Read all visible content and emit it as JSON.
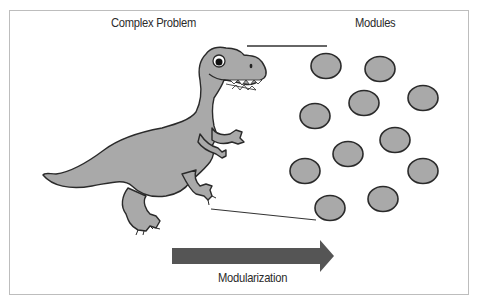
{
  "diagram": {
    "left_title": "Complex Problem",
    "right_title": "Modules",
    "arrow_label": "Modularization",
    "left_subject": "dinosaur",
    "module_count": 11,
    "colors": {
      "fill_gray": "#a9a9a9",
      "outline": "#2a2a2a",
      "arrow": "#555555",
      "frame_border": "#bdbdbd",
      "text": "#2b2b2b"
    },
    "modules": [
      {
        "cx": 326,
        "cy": 66
      },
      {
        "cx": 380,
        "cy": 69
      },
      {
        "cx": 364,
        "cy": 103
      },
      {
        "cx": 423,
        "cy": 98
      },
      {
        "cx": 315,
        "cy": 116
      },
      {
        "cx": 395,
        "cy": 140
      },
      {
        "cx": 348,
        "cy": 154
      },
      {
        "cx": 305,
        "cy": 171
      },
      {
        "cx": 423,
        "cy": 171
      },
      {
        "cx": 383,
        "cy": 199
      },
      {
        "cx": 330,
        "cy": 208
      }
    ]
  }
}
